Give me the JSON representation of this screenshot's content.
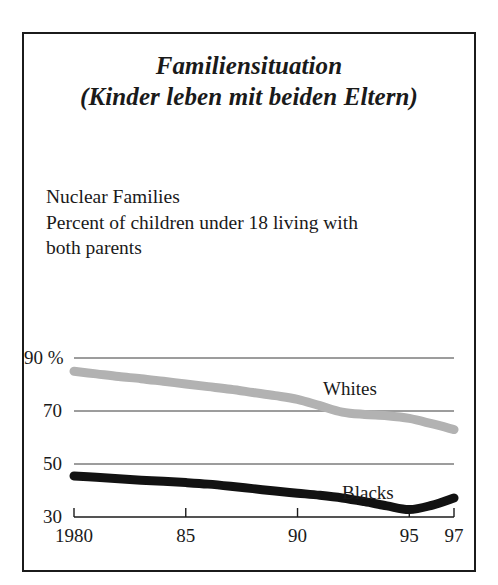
{
  "figure": {
    "title_lines": [
      "Familiensituation",
      "(Kinder leben mit beiden Eltern)"
    ],
    "caption_lines": [
      "Nuclear Families",
      "Percent of children under 18 living with",
      "both parents"
    ],
    "border_color": "#1b1b1b",
    "background_color": "#ffffff"
  },
  "chart_data": {
    "type": "line",
    "title": "Familiensituation (Kinder leben mit beiden Eltern)",
    "subtitle": "Nuclear Families — Percent of children under 18 living with both parents",
    "xlabel": "",
    "ylabel": "",
    "xlim": [
      1980,
      1997
    ],
    "ylim": [
      30,
      90
    ],
    "grid": true,
    "gridlines_y": [
      90,
      70,
      50
    ],
    "legend_position": "inline-on-curve",
    "y_ticks": [
      90,
      70,
      50,
      30
    ],
    "y_tick_labels": [
      "90 %",
      "70",
      "50",
      "30"
    ],
    "x_ticks": [
      1980,
      1985,
      1990,
      1995,
      1997
    ],
    "x_tick_labels": [
      "1980",
      "85",
      "90",
      "95",
      "97"
    ],
    "x": [
      1980,
      1981,
      1982,
      1983,
      1984,
      1985,
      1986,
      1987,
      1988,
      1989,
      1990,
      1991,
      1992,
      1993,
      1994,
      1995,
      1996,
      1997
    ],
    "series": [
      {
        "name": "Whites",
        "color": "#b2b2b2",
        "values": [
          85.0,
          84.0,
          83.0,
          82.2,
          81.2,
          80.2,
          79.2,
          78.2,
          77.0,
          75.8,
          74.4,
          72.0,
          69.6,
          68.7,
          68.2,
          67.2,
          65.2,
          63.0
        ]
      },
      {
        "name": "Blacks",
        "color": "#121212",
        "values": [
          45.5,
          45.0,
          44.4,
          43.9,
          43.5,
          43.0,
          42.4,
          41.6,
          40.7,
          39.8,
          39.0,
          38.2,
          37.2,
          35.8,
          34.2,
          32.8,
          34.4,
          37.2
        ]
      }
    ]
  }
}
